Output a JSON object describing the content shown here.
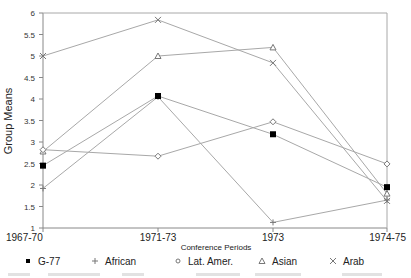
{
  "chart_data": {
    "type": "line",
    "title": "",
    "xlabel": "Conference Periods",
    "ylabel": "Group Means",
    "categories": [
      "1967-70",
      "1971-73",
      "1973",
      "1974-75"
    ],
    "ylim": [
      1,
      6
    ],
    "yticks": [
      1,
      1.5,
      2,
      2.5,
      3,
      3.5,
      4,
      4.5,
      5,
      5.5,
      6
    ],
    "ytick_labels": [
      "1",
      "1.5",
      "2",
      "2.5",
      "3",
      "3.5",
      "4",
      "4.5",
      "5",
      "5.5",
      "6"
    ],
    "grid": false,
    "legend_position": "bottom",
    "series": [
      {
        "name": "G-77",
        "marker": "filled-square",
        "values": [
          2.45,
          4.07,
          3.18,
          1.95
        ]
      },
      {
        "name": "African",
        "marker": "plus",
        "values": [
          1.92,
          4.05,
          1.13,
          1.65
        ]
      },
      {
        "name": "Lat. Amer.",
        "marker": "open-diamond",
        "values": [
          2.82,
          2.67,
          3.47,
          2.49
        ]
      },
      {
        "name": "Asian",
        "marker": "open-triangle",
        "values": [
          2.78,
          5.0,
          5.2,
          1.8
        ]
      },
      {
        "name": "Arab",
        "marker": "x",
        "values": [
          5.0,
          5.84,
          4.84,
          1.63
        ]
      }
    ]
  },
  "colors": {
    "line": "#a8a8a8",
    "axis": "#888888",
    "marker_fill": "#000000"
  }
}
